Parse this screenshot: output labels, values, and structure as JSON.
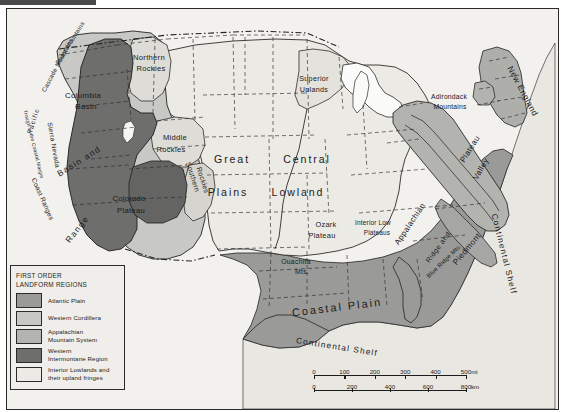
{
  "map": {
    "title_visible": false,
    "background_color": "#f2f1ee",
    "frame_color": "#2a2a2a"
  },
  "legend": {
    "title_line1": "FIRST ORDER",
    "title_line2": "LANDFORM REGIONS",
    "items": [
      {
        "label": "Atlantic Plain",
        "color": "#9a9a99"
      },
      {
        "label": "Western Cordillera",
        "color": "#c8c8c5"
      },
      {
        "label": "Appalachian\nMountain System",
        "color": "#b3b3b0"
      },
      {
        "label": "Western\nIntermontane Region",
        "color": "#6e6e6d"
      },
      {
        "label": "Interior Lowlands and\ntheir upland fringes",
        "color": "#eceae5"
      }
    ]
  },
  "scale": {
    "miles": {
      "ticks": [
        "0",
        "100",
        "200",
        "300",
        "400",
        "500"
      ],
      "unit": "mi"
    },
    "kilometers": {
      "ticks": [
        "0",
        "200",
        "400",
        "600",
        "800"
      ],
      "unit": "km"
    }
  },
  "labels": {
    "west": [
      {
        "id": "pacific-ocean",
        "text": "Pacific",
        "x": 26,
        "y": 112,
        "size": 6.6,
        "rot": -72,
        "spacing": 1.0
      },
      {
        "id": "coast-mountains",
        "text": "Coast Mountains",
        "x": 63,
        "y": 34,
        "size": 6.0,
        "rot": -58,
        "spacing": 0.3
      },
      {
        "id": "cascade-mountains",
        "text": "Cascade Mountains",
        "x": 50,
        "y": 56,
        "size": 6.2,
        "rot": -62,
        "spacing": 0.3
      },
      {
        "id": "columbia-basin",
        "text": "Columbia",
        "x": 76,
        "y": 86,
        "size": 8.0,
        "rot": 0,
        "spacing": 0.3
      },
      {
        "id": "columbia-basin-2",
        "text": "Basin",
        "x": 79,
        "y": 97,
        "size": 8.0,
        "rot": 0,
        "spacing": 0.3
      },
      {
        "id": "northern-rockies",
        "text": "Northern",
        "x": 142,
        "y": 48,
        "size": 7.6,
        "rot": 0,
        "spacing": 0.3
      },
      {
        "id": "northern-rockies-2",
        "text": "Rockies",
        "x": 144,
        "y": 59,
        "size": 7.6,
        "rot": 0,
        "spacing": 0.3
      },
      {
        "id": "middle-rockies",
        "text": "Middle",
        "x": 168,
        "y": 128,
        "size": 7.6,
        "rot": 0,
        "spacing": 0.3
      },
      {
        "id": "middle-rockies-2",
        "text": "Rockies",
        "x": 164,
        "y": 140,
        "size": 7.6,
        "rot": 0,
        "spacing": 0.3
      },
      {
        "id": "southern-rockies",
        "text": "Southern",
        "x": 186,
        "y": 168,
        "size": 7.0,
        "rot": 72,
        "spacing": 0.3
      },
      {
        "id": "southern-rockies-2",
        "text": "Rockies",
        "x": 196,
        "y": 171,
        "size": 7.0,
        "rot": 72,
        "spacing": 0.3
      },
      {
        "id": "trough-coastal-margin",
        "text": "Trough of the Coastal Margin",
        "x": 27,
        "y": 135,
        "size": 5.0,
        "rot": 76,
        "spacing": 0.2
      },
      {
        "id": "sierra-nevada",
        "text": "Sierra Nevada",
        "x": 47,
        "y": 136,
        "size": 6.6,
        "rot": 80,
        "spacing": 0.3
      },
      {
        "id": "coast-ranges",
        "text": "Coast Ranges",
        "x": 36,
        "y": 190,
        "size": 6.6,
        "rot": 66,
        "spacing": 0.3
      },
      {
        "id": "basin-and",
        "text": "Basin  and",
        "x": 72,
        "y": 152,
        "size": 8.4,
        "rot": -32,
        "spacing": 1.4
      },
      {
        "id": "range",
        "text": "Range",
        "x": 70,
        "y": 220,
        "size": 8.4,
        "rot": -52,
        "spacing": 1.4
      },
      {
        "id": "colorado-plateau",
        "text": "Colorado",
        "x": 122,
        "y": 189,
        "size": 7.6,
        "rot": 0,
        "spacing": 0.3
      },
      {
        "id": "colorado-plateau-2",
        "text": "Plateau",
        "x": 124,
        "y": 201,
        "size": 7.6,
        "rot": 0,
        "spacing": 0.3
      }
    ],
    "interior": [
      {
        "id": "great-plains",
        "text": "Great",
        "x": 225,
        "y": 150,
        "size": 10.6,
        "rot": 0,
        "spacing": 1.9
      },
      {
        "id": "great-plains-2",
        "text": "Plains",
        "x": 221,
        "y": 183,
        "size": 10.6,
        "rot": 0,
        "spacing": 1.9
      },
      {
        "id": "central-lowland",
        "text": "Central",
        "x": 300,
        "y": 150,
        "size": 10.6,
        "rot": 0,
        "spacing": 1.9
      },
      {
        "id": "central-lowland-2",
        "text": "Lowland",
        "x": 291,
        "y": 183,
        "size": 10.6,
        "rot": 0,
        "spacing": 1.9
      },
      {
        "id": "superior-uplands",
        "text": "Superior",
        "x": 307,
        "y": 69,
        "size": 7.2,
        "rot": 0,
        "spacing": 0.3
      },
      {
        "id": "superior-uplands-2",
        "text": "Uplands",
        "x": 307,
        "y": 80,
        "size": 7.2,
        "rot": 0,
        "spacing": 0.3
      },
      {
        "id": "ozark-plateau",
        "text": "Ozark",
        "x": 319,
        "y": 215,
        "size": 7.4,
        "rot": 0,
        "spacing": 0.3
      },
      {
        "id": "ozark-plateau-2",
        "text": "Plateau",
        "x": 315,
        "y": 226,
        "size": 7.4,
        "rot": 0,
        "spacing": 0.3
      },
      {
        "id": "ouachita-mts",
        "text": "Ouachita",
        "x": 289,
        "y": 252,
        "size": 6.8,
        "rot": 0,
        "spacing": 0.3
      },
      {
        "id": "ouachita-mts-2",
        "text": "Mts.",
        "x": 295,
        "y": 262,
        "size": 6.8,
        "rot": 0,
        "spacing": 0.3
      },
      {
        "id": "interior-low-plateaus",
        "text": "Interior Low",
        "x": 366,
        "y": 213,
        "size": 6.4,
        "rot": 0,
        "spacing": 0.2
      },
      {
        "id": "interior-low-plateaus-2",
        "text": "Plateaus",
        "x": 370,
        "y": 223,
        "size": 6.4,
        "rot": 0,
        "spacing": 0.2
      }
    ],
    "east": [
      {
        "id": "adirondack-mountains",
        "text": "Adirondack",
        "x": 442,
        "y": 87,
        "size": 6.8,
        "rot": 0,
        "spacing": 0.2
      },
      {
        "id": "adirondack-mountains-2",
        "text": "Mountains",
        "x": 443,
        "y": 97,
        "size": 6.8,
        "rot": 0,
        "spacing": 0.2
      },
      {
        "id": "new-england",
        "text": "New England",
        "x": 516,
        "y": 82,
        "size": 8.4,
        "rot": 62,
        "spacing": 0.5
      },
      {
        "id": "appalachian",
        "text": "Appalachian",
        "x": 403,
        "y": 215,
        "size": 8.0,
        "rot": -56,
        "spacing": 0.4
      },
      {
        "id": "appalachian-plateau",
        "text": "Plateau",
        "x": 463,
        "y": 140,
        "size": 8.0,
        "rot": -58,
        "spacing": 0.4
      },
      {
        "id": "ridge-and",
        "text": "Ridge  and",
        "x": 431,
        "y": 238,
        "size": 7.0,
        "rot": -54,
        "spacing": 0.5
      },
      {
        "id": "valley",
        "text": "Valley",
        "x": 474,
        "y": 160,
        "size": 8.0,
        "rot": -60,
        "spacing": 0.4
      },
      {
        "id": "blue-ridge-mts",
        "text": "Blue Ridge Mts.",
        "x": 437,
        "y": 252,
        "size": 6.0,
        "rot": -44,
        "spacing": 0.2
      },
      {
        "id": "piedmont",
        "text": "Piedmont",
        "x": 460,
        "y": 240,
        "size": 8.2,
        "rot": -50,
        "spacing": 0.5
      }
    ],
    "coastal": [
      {
        "id": "coastal-plain",
        "text": "Coastal  Plain",
        "x": 330,
        "y": 298,
        "size": 11.0,
        "rot": -7,
        "spacing": 2.0
      },
      {
        "id": "continental-shelf-atlantic",
        "text": "Continental  Shelf",
        "x": 497,
        "y": 245,
        "size": 8.2,
        "rot": 76,
        "spacing": 1.2
      },
      {
        "id": "continental-shelf-gulf",
        "text": "Continental  Shelf",
        "x": 330,
        "y": 338,
        "size": 8.2,
        "rot": 9,
        "spacing": 1.2
      }
    ]
  }
}
